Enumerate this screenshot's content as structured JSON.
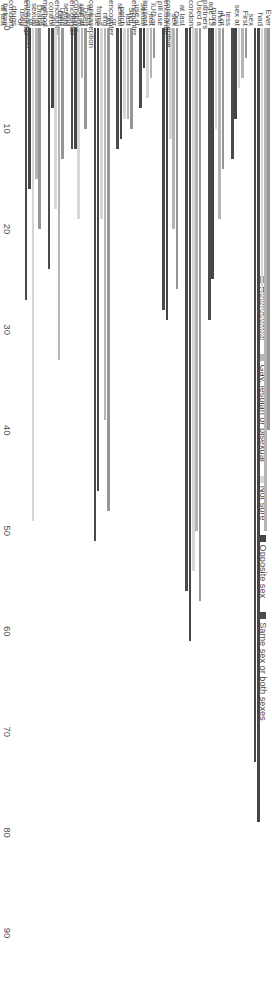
{
  "chart_data": {
    "type": "bar",
    "orientation": "horizontal-grouped",
    "title": "",
    "subtitle": "",
    "xlabel": "",
    "ylabel": "",
    "ylim": [
      0,
      90
    ],
    "grid": false,
    "legend_position": "top",
    "axis_ticks": [
      "0",
      "10",
      "20",
      "30",
      "40",
      "50",
      "60",
      "70",
      "80",
      "90"
    ],
    "categories": [
      "Ever had sex",
      "First sex at less than age 13",
      "4 or more partners",
      "Used a condom at last sex encounter",
      "Oral contraceptive pill use last sexual encounter",
      "IUD or implant use at last sexual encounter",
      "Shot, patch or ring use at last sexual encounter",
      "All forms contraception use at last sexual encounter",
      "Used condoms and birth control at last sexual encounter",
      "Used no method of contraception or condom at last sexual encounter",
      "Drank or used drugs before last sexual encounter"
    ],
    "category_lines": [
      [
        "Ever had sex"
      ],
      [
        "First sex at less",
        "than age 13"
      ],
      [
        "4 or more",
        "partners"
      ],
      [
        "Used a condom",
        "at last",
        "sex encounter"
      ],
      [
        "Oral contraceptive",
        "pill use last",
        "sexual encounter"
      ],
      [
        "IUD or implant",
        "use at last",
        "sexual encounter"
      ],
      [
        "Shot, patch or",
        "ring use",
        "at last sexual",
        "encounter"
      ],
      [
        "All forms",
        "contraception",
        "use at last sexual",
        "encounter"
      ],
      [
        "Used condoms",
        "and birth",
        "control at last",
        "sexual encounter"
      ],
      [
        "Used no method",
        "of contraception",
        "or",
        "condom at last",
        "sexual encounter"
      ],
      [
        "Drank or used drugs",
        "before last sexual",
        "encounter"
      ]
    ],
    "series": [
      {
        "name": "Heterosexual",
        "color": "#969696",
        "values": [
          40,
          3,
          14,
          57,
          26,
          3,
          10,
          48,
          10,
          13,
          20
        ]
      },
      {
        "name": "Gay, lesbian or bisexual",
        "color": "#b5b5b5",
        "values": [
          50,
          5,
          19,
          50,
          20,
          5,
          9,
          39,
          5,
          33,
          15
        ]
      },
      {
        "name": "Not sure",
        "color": "#d6d6d6",
        "values": [
          31,
          6,
          10,
          54,
          11,
          7,
          9,
          19,
          19,
          18,
          49
        ]
      },
      {
        "name": "Opposite sex",
        "color": "#454545",
        "values": [
          79,
          9,
          25,
          61,
          29,
          4,
          11,
          46,
          12,
          8,
          16
        ]
      },
      {
        "name": "Same sex or both sexes",
        "color": "#4a4a4a",
        "values": [
          73,
          13,
          29,
          56,
          28,
          8,
          12,
          51,
          12,
          24,
          27
        ]
      }
    ]
  },
  "legend": {
    "items": [
      {
        "label": "Heterosexual",
        "color": "#969696"
      },
      {
        "label": "Gay, lesbian or bisexual",
        "color": "#b5b5b5"
      },
      {
        "label": "Not sure",
        "color": "#d6d6d6"
      },
      {
        "label": "Opposite sex",
        "color": "#454545"
      },
      {
        "label": "Same sex or both sexes",
        "color": "#4a4a4a"
      }
    ]
  }
}
